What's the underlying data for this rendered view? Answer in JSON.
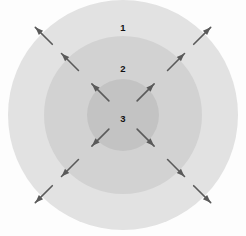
{
  "diagram": {
    "type": "concentric-circles",
    "background_color": "#fdfdfd",
    "canvas": {
      "width": 246,
      "height": 236
    },
    "center": {
      "x": 123,
      "y": 115
    },
    "zones": [
      {
        "id": "zone-1",
        "label": "1",
        "role": "outer-ring",
        "radius": 115,
        "fill": "#e2e2e2",
        "label_position": {
          "x": 123,
          "y": 28
        }
      },
      {
        "id": "zone-2",
        "label": "2",
        "role": "middle-ring",
        "radius": 79,
        "fill": "#d2d2d2",
        "label_position": {
          "x": 123,
          "y": 69
        }
      },
      {
        "id": "zone-3",
        "label": "3",
        "role": "inner-core",
        "radius": 36,
        "fill": "#c3c3c3",
        "label_position": {
          "x": 123,
          "y": 119
        }
      }
    ],
    "arrows": {
      "color": "#5a5a5a",
      "direction": "outward",
      "count": 12,
      "shaft_length": 24,
      "head_length": 8,
      "head_width": 6,
      "stroke_width": 1.6,
      "angles_deg": [
        225,
        315,
        45,
        135
      ],
      "rings": [
        {
          "ring_id": "inner-core-boundary",
          "start_radius": 20
        },
        {
          "ring_id": "middle-ring-boundary",
          "start_radius": 63
        },
        {
          "ring_id": "outer-ring-boundary",
          "start_radius": 100
        }
      ],
      "items": [
        {
          "id": "arrow-inner-nw",
          "ring": "inner-core-boundary",
          "angle_deg": 225
        },
        {
          "id": "arrow-inner-ne",
          "ring": "inner-core-boundary",
          "angle_deg": 315
        },
        {
          "id": "arrow-inner-se",
          "ring": "inner-core-boundary",
          "angle_deg": 45
        },
        {
          "id": "arrow-inner-sw",
          "ring": "inner-core-boundary",
          "angle_deg": 135
        },
        {
          "id": "arrow-middle-nw",
          "ring": "middle-ring-boundary",
          "angle_deg": 225
        },
        {
          "id": "arrow-middle-ne",
          "ring": "middle-ring-boundary",
          "angle_deg": 315
        },
        {
          "id": "arrow-middle-se",
          "ring": "middle-ring-boundary",
          "angle_deg": 45
        },
        {
          "id": "arrow-middle-sw",
          "ring": "middle-ring-boundary",
          "angle_deg": 135
        },
        {
          "id": "arrow-outer-nw",
          "ring": "outer-ring-boundary",
          "angle_deg": 225
        },
        {
          "id": "arrow-outer-ne",
          "ring": "outer-ring-boundary",
          "angle_deg": 315
        },
        {
          "id": "arrow-outer-se",
          "ring": "outer-ring-boundary",
          "angle_deg": 45
        },
        {
          "id": "arrow-outer-sw",
          "ring": "outer-ring-boundary",
          "angle_deg": 135
        }
      ]
    }
  }
}
